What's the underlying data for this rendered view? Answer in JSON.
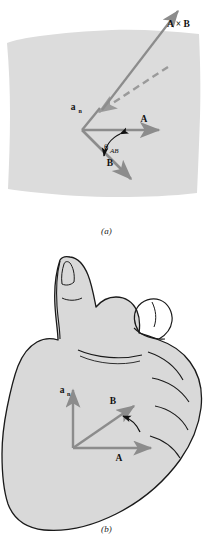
{
  "figure": {
    "type": "vector-diagram"
  },
  "colors": {
    "plane_fill": "#dcdcdc",
    "hand_fill": "#d9d9d9",
    "vector_gray": "#8c8c8c",
    "vector_gray_dark": "#7a7a7a",
    "outline": "#1a1a1a",
    "text": "#111111",
    "background": "#ffffff"
  },
  "panel_a": {
    "caption": "(a)",
    "plane_label": "plane containing A and B",
    "vectors": [
      {
        "name": "A",
        "label": "A",
        "subscript": "",
        "direction": "right",
        "style": "solid"
      },
      {
        "name": "B",
        "label": "B",
        "subscript": "",
        "direction": "down-right",
        "style": "solid"
      },
      {
        "name": "a_n",
        "label": "a",
        "subscript": "n",
        "direction": "up-right",
        "style": "solid"
      },
      {
        "name": "A_cross_B",
        "label": "A × B",
        "subscript": "",
        "direction": "up-right",
        "style": "solid"
      }
    ],
    "dashed_segment_label": "normal extension",
    "angle": {
      "label": "θ",
      "subscript": "AB"
    }
  },
  "panel_b": {
    "caption": "(b)",
    "hand_label": "right hand",
    "vectors": [
      {
        "name": "A",
        "label": "A",
        "subscript": "",
        "direction": "right"
      },
      {
        "name": "B",
        "label": "B",
        "subscript": "",
        "direction": "up-right"
      },
      {
        "name": "a_n",
        "label": "a",
        "subscript": "n",
        "direction": "up"
      }
    ],
    "rotation_arrow_label": "rotation from A to B"
  }
}
